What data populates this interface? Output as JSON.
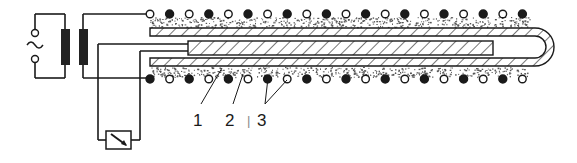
{
  "diagram": {
    "title": "",
    "labels": [
      {
        "id": "1",
        "text": "1",
        "refers_to": "inner-heater-rod"
      },
      {
        "id": "2",
        "text": "2",
        "refers_to": "outer-tube-wall"
      },
      {
        "id": "3",
        "text": "3",
        "refers_to": "particles-in-powder-bed"
      }
    ],
    "stray_mark": "|",
    "components": [
      "ac-source",
      "transformer",
      "outer-tube",
      "inner-heater-rod",
      "powder-bed",
      "particles",
      "meter"
    ],
    "colors": {
      "line": "#1a1a1a",
      "core": "#222222",
      "powder": "#555555",
      "background": "#ffffff"
    }
  }
}
